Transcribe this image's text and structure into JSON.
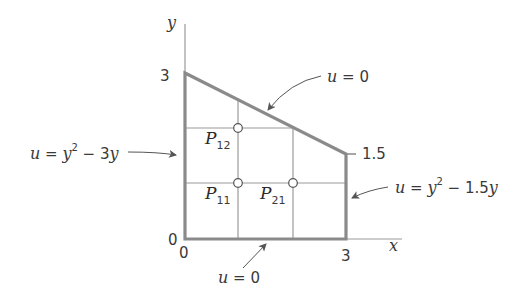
{
  "axes": {
    "x_label": "x",
    "y_label": "y",
    "origin_x_tick": "0",
    "origin_y_tick": "0",
    "x_tick_3": "3",
    "y_tick_3": "3",
    "y_tick_1_5": "1.5"
  },
  "boundaries": {
    "top": {
      "lhs": "u",
      "eq": " = ",
      "rhs": "0"
    },
    "bottom": {
      "lhs": "u",
      "eq": " = ",
      "rhs": "0"
    },
    "left": {
      "lhs": "u",
      "eq": " = ",
      "y1": "y",
      "exp": "2",
      "minus": " − 3",
      "y2": "y"
    },
    "right": {
      "lhs": "u",
      "eq": " = ",
      "y1": "y",
      "exp": "2",
      "minus": " − 1.5",
      "y2": "y"
    }
  },
  "points": [
    {
      "name": "P",
      "sub": "12"
    },
    {
      "name": "P",
      "sub": "11"
    },
    {
      "name": "P",
      "sub": "21"
    }
  ],
  "colors": {
    "boundary": "#8a8a8a",
    "grid": "#9a9a9a",
    "text": "#3a3a3a"
  }
}
